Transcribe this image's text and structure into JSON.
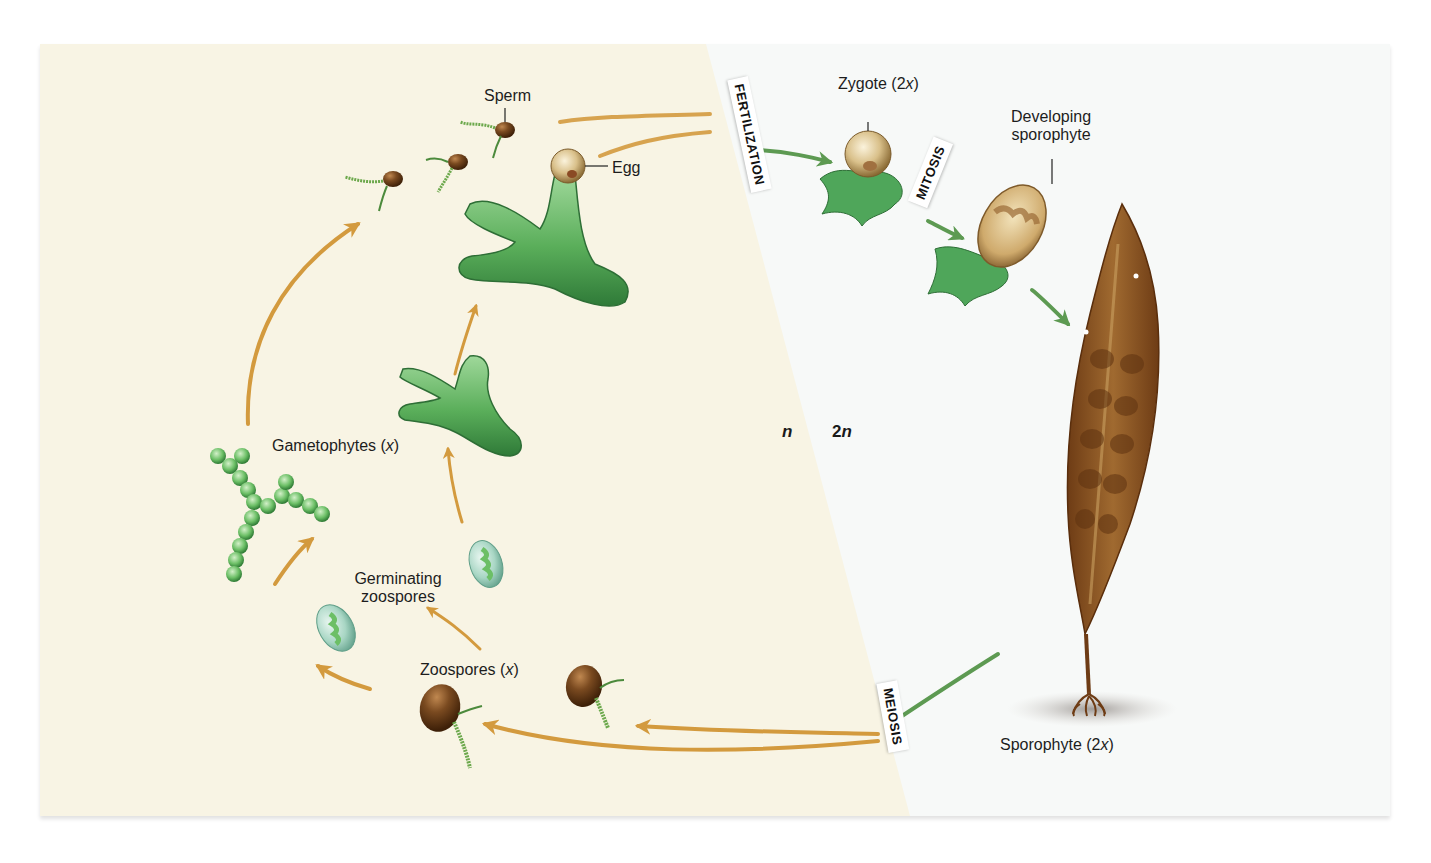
{
  "figure": {
    "type": "life-cycle-diagram",
    "colors": {
      "haploid_bg": "#f8f4e4",
      "diploid_bg": "#f7f9f8",
      "haploid_arrow": "#d39a3e",
      "diploid_arrow": "#5d9a52",
      "gametophyte_green": "#5fae5c",
      "zoospore_brown": "#6b3f1a",
      "sporophyte_brown": "#8a5424"
    }
  },
  "regions": {
    "haploid_label": "n",
    "diploid_label": "2n",
    "diploid_label_num": "2",
    "diploid_label_var": "n"
  },
  "process_tags": {
    "fertilization": "FERTILIZATION",
    "mitosis": "MITOSIS",
    "meiosis": "MEIOSIS"
  },
  "labels": {
    "sperm": "Sperm",
    "egg": "Egg",
    "zygote_prefix": "Zygote (2",
    "zygote_var": "x",
    "zygote_suffix": ")",
    "developing_line1": "Developing",
    "developing_line2": "sporophyte",
    "gametophytes_prefix": "Gametophytes (",
    "gametophytes_var": "x",
    "gametophytes_suffix": ")",
    "germinating_line1": "Germinating",
    "germinating_line2": "zoospores",
    "zoospores_prefix": "Zoospores (",
    "zoospores_var": "x",
    "zoospores_suffix": ")",
    "sporophyte_prefix": "Sporophyte (2",
    "sporophyte_var": "x",
    "sporophyte_suffix": ")"
  }
}
